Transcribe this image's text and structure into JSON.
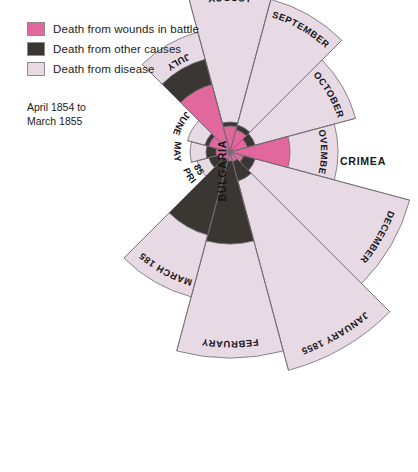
{
  "legend": {
    "items": [
      {
        "label": "Death from wounds in battle",
        "color": "#e2679d",
        "key": "wounds"
      },
      {
        "label": "Death from other causes",
        "color": "#3a3733",
        "key": "other"
      },
      {
        "label": "Death from disease",
        "color": "#e8dae5",
        "key": "disease"
      }
    ]
  },
  "caption": {
    "text": "April  1854 to\nMarch 1855"
  },
  "annotations": {
    "bulgaria": "BULGARIA",
    "crimea": "CRIMEA"
  },
  "colors": {
    "wounds": "#e2679d",
    "other": "#3a3733",
    "disease": "#e8dae5",
    "outline": "#6f6a72",
    "text": "#16161a",
    "background": "#ffffff"
  },
  "chart_data": {
    "type": "pie",
    "variant": "polar-area-rose",
    "title": "",
    "subtitle": "April 1854 to March 1855",
    "center": {
      "x": 230,
      "y": 152
    },
    "sector_span_degrees": 30,
    "start_angle_degrees": 225,
    "direction": "clockwise",
    "series": [
      {
        "name": "Death from wounds in battle",
        "color": "#e2679d",
        "values": [
          12,
          14,
          22,
          70,
          26,
          23,
          18,
          60,
          14,
          10,
          9,
          8
        ]
      },
      {
        "name": "Death from other causes",
        "color": "#3a3733",
        "values": [
          22,
          24,
          26,
          96,
          30,
          28,
          26,
          24,
          26,
          30,
          92,
          86
        ]
      },
      {
        "name": "Death from disease",
        "color": "#e8dae5",
        "values": [
          34,
          40,
          44,
          124,
          168,
          158,
          130,
          108,
          186,
          226,
          206,
          150
        ]
      }
    ],
    "categories": [
      "APRIL 1854",
      "MAY",
      "JUNE",
      "JULY",
      "AUGUST",
      "SEPTEMBER",
      "OCTOBER",
      "NOVEMBER",
      "DECEMBER",
      "JANUARY 1855",
      "FEBRUARY",
      "MARCH 1855"
    ],
    "labels": [
      {
        "text": "APRIL",
        "second_line": "1854",
        "sector": 0
      },
      {
        "text": "MAY",
        "sector": 1
      },
      {
        "text": "JUNE",
        "sector": 2
      },
      {
        "text": "JULY",
        "sector": 3
      },
      {
        "text": "AUGUST",
        "sector": 4
      },
      {
        "text": "SEPTEMBER",
        "sector": 5
      },
      {
        "text": "OCTOBER",
        "sector": 6
      },
      {
        "text": "NOVEMBER",
        "sector": 7
      },
      {
        "text": "DECEMBER",
        "sector": 8
      },
      {
        "text": "JANUARY 1855",
        "sector": 9
      },
      {
        "text": "FEBRUARY",
        "sector": 10
      },
      {
        "text": "MARCH 1855",
        "sector": 11
      }
    ],
    "grid": false,
    "legend_position": "top-left",
    "xlabel": "",
    "ylabel": ""
  }
}
